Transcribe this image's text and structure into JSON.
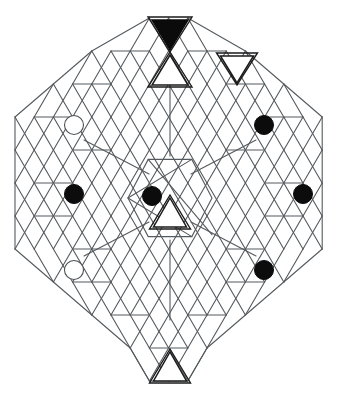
{
  "figure": {
    "type": "geometric-diagram",
    "background_color": "#ffffff",
    "line_color": "#555a5e",
    "accent_dark": "#0b0b0b",
    "canvas": {
      "width": 339,
      "height": 402
    },
    "lattice": {
      "origin_x": 15,
      "origin_y": 18,
      "cell_width": 38.4,
      "row_height": 33.0,
      "description": "Isometric triangular grid of rhombi arranged in an octagonal silhouette"
    },
    "markers": [
      {
        "id": "marker-upper-left",
        "kind": "open-circle",
        "label": "open",
        "x": 74,
        "y": 125,
        "r": 9.5,
        "fill": "#ffffff",
        "stroke": "#4a4f53"
      },
      {
        "id": "marker-mid-left",
        "kind": "filled-circle",
        "label": "filled",
        "x": 74,
        "y": 194,
        "r": 9.5,
        "fill": "#0c0c0c",
        "stroke": "#0c0c0c"
      },
      {
        "id": "marker-lower-left",
        "kind": "open-circle",
        "label": "open",
        "x": 74,
        "y": 270,
        "r": 9.5,
        "fill": "#ffffff",
        "stroke": "#4a4f53"
      },
      {
        "id": "marker-upper-right",
        "kind": "filled-circle",
        "label": "filled",
        "x": 264,
        "y": 125,
        "r": 9.5,
        "fill": "#0c0c0c",
        "stroke": "#0c0c0c"
      },
      {
        "id": "marker-mid-right",
        "kind": "filled-circle",
        "label": "filled",
        "x": 303,
        "y": 194,
        "r": 9.5,
        "fill": "#0c0c0c",
        "stroke": "#0c0c0c"
      },
      {
        "id": "marker-lower-right",
        "kind": "filled-circle",
        "label": "filled",
        "x": 264,
        "y": 270,
        "r": 9.5,
        "fill": "#0c0c0c",
        "stroke": "#0c0c0c"
      },
      {
        "id": "marker-center",
        "kind": "filled-circle",
        "label": "filled",
        "x": 152,
        "y": 196,
        "r": 9.5,
        "fill": "#0c0c0c",
        "stroke": "#0c0c0c"
      }
    ],
    "triangles": [
      {
        "id": "triangle-top-filled",
        "kind": "filled-down",
        "label": "solid inverted triangle",
        "cx": 170,
        "cy": 20,
        "w": 36,
        "h": 30,
        "orientation": "down",
        "fill": "#0b0b0b"
      },
      {
        "id": "triangle-top-outline",
        "kind": "outline-up",
        "label": "hollow upright triangle",
        "cx": 170,
        "cy": 55,
        "w": 36,
        "h": 30,
        "orientation": "up",
        "fill": "#ffffff"
      },
      {
        "id": "triangle-topright-outline",
        "kind": "outline-down",
        "label": "hollow inverted triangle",
        "cx": 237,
        "cy": 56,
        "w": 33,
        "h": 27,
        "orientation": "down",
        "fill": "#ffffff"
      },
      {
        "id": "triangle-center-outline",
        "kind": "outline-up",
        "label": "hollow upright triangle",
        "cx": 170,
        "cy": 198,
        "w": 33,
        "h": 29,
        "orientation": "up",
        "fill": "#ffffff"
      },
      {
        "id": "triangle-bottom-outline",
        "kind": "outline-up",
        "label": "hollow upright triangle",
        "cx": 170,
        "cy": 352,
        "w": 33,
        "h": 29,
        "orientation": "up",
        "fill": "#ffffff"
      }
    ],
    "center_hub": {
      "id": "center-hexagon",
      "label": "central hexagon node",
      "cx": 170,
      "cy": 198,
      "radius": 42
    },
    "spokes": [
      {
        "id": "spoke-north",
        "from": "center-hexagon",
        "to": "triangle-top-outline",
        "x1": 170,
        "y1": 156,
        "x2": 170,
        "y2": 78
      },
      {
        "id": "spoke-south",
        "from": "center-hexagon",
        "to": "triangle-bottom-outline",
        "x1": 170,
        "y1": 240,
        "x2": 170,
        "y2": 320
      },
      {
        "id": "spoke-northwest",
        "from": "center-hexagon",
        "to": "marker-upper-left",
        "x1": 149,
        "y1": 174,
        "x2": 84,
        "y2": 140
      },
      {
        "id": "spoke-southwest",
        "from": "center-hexagon",
        "to": "marker-lower-left",
        "x1": 149,
        "y1": 222,
        "x2": 84,
        "y2": 256
      },
      {
        "id": "spoke-northeast",
        "from": "center-hexagon",
        "to": "marker-upper-right",
        "x1": 191,
        "y1": 174,
        "x2": 256,
        "y2": 140
      },
      {
        "id": "spoke-southeast",
        "from": "center-hexagon",
        "to": "marker-lower-right",
        "x1": 191,
        "y1": 222,
        "x2": 256,
        "y2": 256
      }
    ],
    "counts": {
      "open_circles": 2,
      "filled_circles": 5,
      "filled_triangles": 1,
      "outline_triangles": 4,
      "spokes": 6
    }
  }
}
